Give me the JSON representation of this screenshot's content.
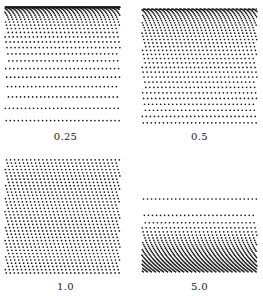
{
  "figure": {
    "background": "#ffffff",
    "dot_color": "#1a1a1a",
    "panels": [
      {
        "label": "0.25",
        "exponent": 0.25,
        "box": [
          4,
          6,
          117,
          120
        ],
        "label_y": 131
      },
      {
        "label": "0.5",
        "exponent": 0.5,
        "box": [
          141,
          8,
          117,
          118
        ],
        "label_y": 131
      },
      {
        "label": "1.0",
        "exponent": 1.0,
        "box": [
          4,
          158,
          117,
          117
        ],
        "label_y": 281
      },
      {
        "label": "5.0",
        "exponent": 5.0,
        "box": [
          141,
          155,
          117,
          118
        ],
        "label_y": 281
      }
    ],
    "lattice": {
      "spacing": 4.1,
      "angle_deg": 63,
      "dot_radius": 0.85
    }
  }
}
